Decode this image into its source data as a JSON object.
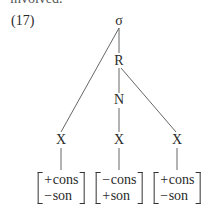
{
  "cut_text": "involved.",
  "example_number": "(17)",
  "tree": {
    "root": "σ",
    "rhyme": "R",
    "nucleus": "N",
    "skeleton": [
      "X",
      "X",
      "X"
    ],
    "feature_matrices": [
      [
        {
          "sign": "+",
          "feature": "cons"
        },
        {
          "sign": "−",
          "feature": "son"
        }
      ],
      [
        {
          "sign": "−",
          "feature": "cons"
        },
        {
          "sign": "+",
          "feature": "son"
        }
      ],
      [
        {
          "sign": "+",
          "feature": "cons"
        },
        {
          "sign": "−",
          "feature": "son"
        }
      ]
    ]
  }
}
